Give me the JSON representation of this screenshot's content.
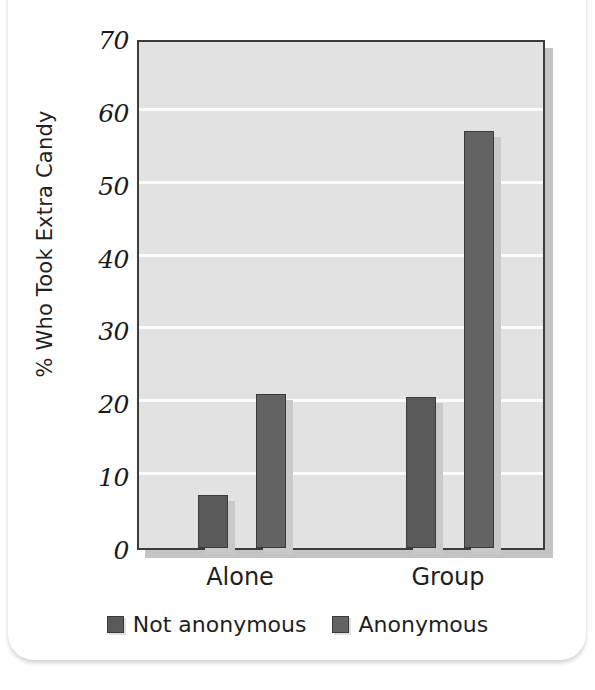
{
  "card": {
    "top_clip_text": ""
  },
  "chart_data": {
    "type": "bar",
    "title": "",
    "xlabel": "",
    "ylabel": "% Who Took Extra Candy",
    "categories": [
      "Alone",
      "Group"
    ],
    "series": [
      {
        "name": "Not anonymous",
        "color": "#5a5a5a",
        "values": [
          7.3,
          20.7
        ]
      },
      {
        "name": "Anonymous",
        "color": "#636363",
        "values": [
          21.2,
          57.2
        ]
      }
    ],
    "ylim": [
      0,
      70
    ],
    "yticks": [
      0,
      10,
      20,
      30,
      40,
      50,
      60,
      70
    ],
    "ytick_labels": [
      "0",
      "10",
      "20",
      "30",
      "40",
      "50",
      "60",
      "70"
    ],
    "grid": true,
    "grid_color": "#fbfbfb",
    "plot_background": "#e2e2e2",
    "legend_position": "bottom"
  }
}
